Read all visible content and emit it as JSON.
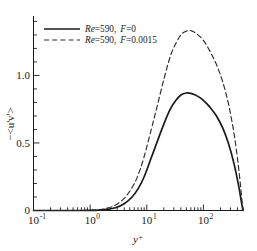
{
  "chart_data": {
    "type": "line",
    "title": "",
    "xlabel": "y+",
    "ylabel": "-<u'v'>",
    "xscale": "log",
    "yscale": "linear",
    "xlim": [
      0.1,
      500
    ],
    "ylim": [
      0,
      1.44
    ],
    "grid": false,
    "legend_position": "top-left",
    "xticks": [
      {
        "value": 0.1,
        "label_mantissa": "10",
        "label_exponent": "-1"
      },
      {
        "value": 1,
        "label_mantissa": "10",
        "label_exponent": "0"
      },
      {
        "value": 10,
        "label_mantissa": "10",
        "label_exponent": "1"
      },
      {
        "value": 100,
        "label_mantissa": "10",
        "label_exponent": "2"
      }
    ],
    "yticks": [
      {
        "value": 0,
        "label": "0"
      },
      {
        "value": 0.5,
        "label": "0.5"
      },
      {
        "value": 1.0,
        "label": "1.0"
      }
    ],
    "yticks_minor": [
      0.1,
      0.2,
      0.3,
      0.4,
      0.6,
      0.7,
      0.8,
      0.9,
      1.1,
      1.2,
      1.3,
      1.4
    ],
    "series": [
      {
        "name": "Re=590,  F=0",
        "legend_re_label": "Re",
        "legend_re_value": "=590,",
        "legend_f_label": "F",
        "legend_f_value": "=0",
        "style": "solid",
        "color": "#1a1a1a",
        "width": 1.7,
        "peak_x": 50,
        "peak_y": 0.87,
        "x": [
          0.1,
          0.2,
          0.4,
          0.7,
          1.0,
          1.4,
          2.0,
          2.8,
          4.0,
          5.5,
          7.0,
          9.0,
          12.0,
          15.0,
          20.0,
          26.0,
          32.0,
          40.0,
          50.0,
          62.0,
          80.0,
          100.0,
          130.0,
          170.0,
          220.0,
          280.0,
          350.0,
          420.0,
          470.0,
          500.0
        ],
        "y": [
          0.0,
          0.0,
          0.0,
          0.0,
          0.001,
          0.003,
          0.008,
          0.02,
          0.05,
          0.1,
          0.16,
          0.25,
          0.39,
          0.5,
          0.64,
          0.75,
          0.81,
          0.855,
          0.87,
          0.865,
          0.845,
          0.815,
          0.765,
          0.7,
          0.61,
          0.49,
          0.34,
          0.18,
          0.06,
          0.0
        ]
      },
      {
        "name": "Re=590,  F=0.0015",
        "legend_re_label": "Re",
        "legend_re_value": "=590,",
        "legend_f_label": "F",
        "legend_f_value": "=0.0015",
        "style": "dashed",
        "color": "#2b2b2b",
        "width": 1.15,
        "peak_x": 55,
        "peak_y": 1.33,
        "x": [
          0.1,
          0.2,
          0.4,
          0.7,
          1.0,
          1.4,
          2.0,
          2.8,
          4.0,
          5.5,
          7.0,
          9.0,
          12.0,
          15.0,
          20.0,
          26.0,
          32.0,
          40.0,
          50.0,
          62.0,
          80.0,
          100.0,
          130.0,
          170.0,
          220.0,
          280.0,
          350.0,
          420.0,
          470.0,
          500.0
        ],
        "y": [
          0.0,
          0.0,
          0.0,
          0.0,
          0.002,
          0.006,
          0.016,
          0.04,
          0.09,
          0.17,
          0.26,
          0.4,
          0.6,
          0.76,
          0.97,
          1.14,
          1.23,
          1.3,
          1.328,
          1.33,
          1.3,
          1.26,
          1.18,
          1.08,
          0.95,
          0.78,
          0.56,
          0.31,
          0.11,
          0.0
        ]
      }
    ]
  },
  "axis_label_x": {
    "base": "y",
    "sup": "+"
  },
  "axis_label_y": "−<u'v'>"
}
